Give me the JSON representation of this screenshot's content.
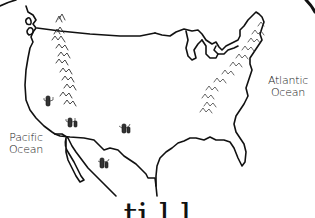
{
  "map": {
    "title": "Hand-drawn map of the United States",
    "style": "black ink line sketch on white",
    "colors": {
      "ink": "#111111",
      "background": "#ffffff",
      "mountain_marks": "#333333"
    },
    "labels": {
      "atlantic": [
        "Atlantic",
        "Ocean"
      ],
      "pacific": [
        "Pacific",
        "Ocean"
      ]
    },
    "features": {
      "mountain_ranges": [
        "rocky-mountains",
        "appalachian-mountains"
      ],
      "icons": [
        "cactus-icon",
        "cactus-icon",
        "cactus-icon",
        "cactus-icon",
        "cactus-icon"
      ]
    },
    "caption_partial": "ti   l         l"
  }
}
